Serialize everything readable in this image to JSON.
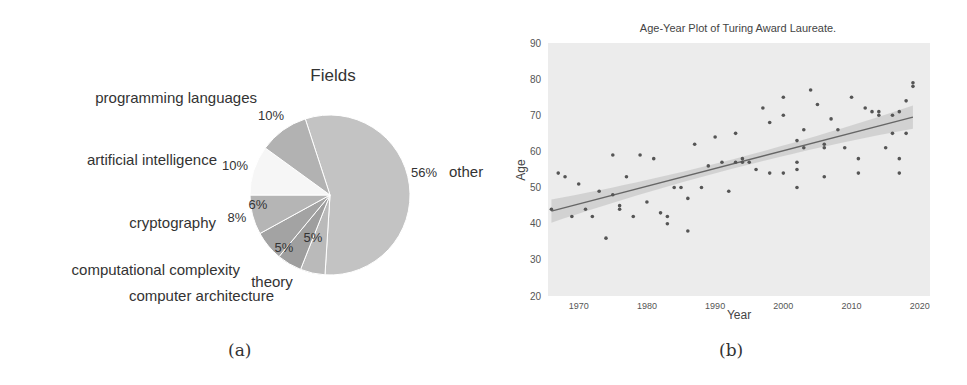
{
  "chart_data": [
    {
      "type": "pie",
      "title": "Fields",
      "caption": "(a)",
      "slices": [
        {
          "label": "other",
          "value": 56,
          "pct_label": "56%",
          "color": "#c3c3c3"
        },
        {
          "label": "theory",
          "value": 5,
          "pct_label": "5%",
          "color": "#bababa"
        },
        {
          "label": "computer architecture",
          "value": 5,
          "pct_label": "5%",
          "color": "#9e9e9e"
        },
        {
          "label": "computational complexity",
          "value": 6,
          "pct_label": "6%",
          "color": "#a3a3a3"
        },
        {
          "label": "cryptography",
          "value": 8,
          "pct_label": "8%",
          "color": "#b5b5b5"
        },
        {
          "label": "artificial intelligence",
          "value": 10,
          "pct_label": "10%",
          "color": "#f6f6f6"
        },
        {
          "label": "programming languages",
          "value": 10,
          "pct_label": "10%",
          "color": "#b2b2b2"
        }
      ]
    },
    {
      "type": "scatter",
      "title": "Age-Year Plot of Turing Award Laureate.",
      "caption": "(b)",
      "xlabel": "Year",
      "ylabel": "Age",
      "xlim": [
        1965.5,
        2021.5
      ],
      "ylim": [
        20,
        90
      ],
      "xticks": [
        1970,
        1980,
        1990,
        2000,
        2010,
        2020
      ],
      "yticks": [
        20,
        30,
        40,
        50,
        60,
        70,
        80,
        90
      ],
      "grid": false,
      "regression": {
        "x": [
          1966,
          2019
        ],
        "y": [
          43.5,
          69.5
        ],
        "ci_halfwidth": [
          3.2,
          3.2
        ],
        "ci_mid_halfwidth": 1.3
      },
      "points": [
        [
          1966,
          44
        ],
        [
          1967,
          54
        ],
        [
          1968,
          53
        ],
        [
          1969,
          42
        ],
        [
          1970,
          51
        ],
        [
          1971,
          44
        ],
        [
          1972,
          42
        ],
        [
          1973,
          49
        ],
        [
          1974,
          36
        ],
        [
          1975,
          59
        ],
        [
          1975,
          48
        ],
        [
          1976,
          45
        ],
        [
          1976,
          44
        ],
        [
          1977,
          53
        ],
        [
          1978,
          42
        ],
        [
          1979,
          59
        ],
        [
          1980,
          46
        ],
        [
          1981,
          58
        ],
        [
          1982,
          43
        ],
        [
          1983,
          42
        ],
        [
          1983,
          40
        ],
        [
          1984,
          50
        ],
        [
          1985,
          50
        ],
        [
          1986,
          47
        ],
        [
          1986,
          38
        ],
        [
          1987,
          62
        ],
        [
          1988,
          50
        ],
        [
          1989,
          56
        ],
        [
          1990,
          64
        ],
        [
          1991,
          57
        ],
        [
          1992,
          49
        ],
        [
          1993,
          65
        ],
        [
          1993,
          57
        ],
        [
          1994,
          58
        ],
        [
          1994,
          57
        ],
        [
          1995,
          57
        ],
        [
          1996,
          55
        ],
        [
          1997,
          72
        ],
        [
          1998,
          68
        ],
        [
          1998,
          54
        ],
        [
          2000,
          75
        ],
        [
          2000,
          70
        ],
        [
          2000,
          54
        ],
        [
          2002,
          63
        ],
        [
          2002,
          57
        ],
        [
          2002,
          55
        ],
        [
          2002,
          50
        ],
        [
          2003,
          66
        ],
        [
          2003,
          61
        ],
        [
          2004,
          77
        ],
        [
          2005,
          73
        ],
        [
          2006,
          62
        ],
        [
          2006,
          61
        ],
        [
          2006,
          53
        ],
        [
          2007,
          69
        ],
        [
          2008,
          66
        ],
        [
          2009,
          61
        ],
        [
          2010,
          75
        ],
        [
          2011,
          58
        ],
        [
          2011,
          54
        ],
        [
          2012,
          72
        ],
        [
          2013,
          71
        ],
        [
          2014,
          71
        ],
        [
          2014,
          70
        ],
        [
          2015,
          61
        ],
        [
          2016,
          70
        ],
        [
          2016,
          65
        ],
        [
          2017,
          71
        ],
        [
          2017,
          58
        ],
        [
          2017,
          54
        ],
        [
          2018,
          74
        ],
        [
          2018,
          65
        ],
        [
          2019,
          79
        ],
        [
          2019,
          78
        ]
      ]
    }
  ],
  "colors": {
    "plot_bg": "#ececec",
    "point": "#555555",
    "line": "#666666",
    "ci_band": "#cfcfcf",
    "text": "#333333",
    "slice_edge": "#ffffff"
  }
}
